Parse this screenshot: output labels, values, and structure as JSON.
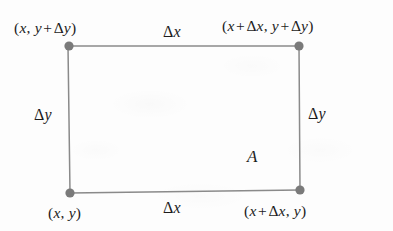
{
  "figure": {
    "type": "geometry-diagram",
    "background_color": "#fdfdfd",
    "line_color": "#8a8a8a",
    "vertex_dot_color": "#7a7a7a",
    "text_color": "#1c1c1c",
    "rectangle": {
      "corners": [
        {
          "name": "bottom-left",
          "x": 70,
          "y": 193,
          "label": "(x, y)"
        },
        {
          "name": "bottom-right",
          "x": 300,
          "y": 190,
          "label": "(x + Δx, y)"
        },
        {
          "name": "top-right",
          "x": 299,
          "y": 46,
          "label": "(x + Δx, y + Δy)"
        },
        {
          "name": "top-left",
          "x": 68,
          "y": 46,
          "label": "(x, y + Δy)"
        }
      ]
    },
    "labels": {
      "top_left_vertex": {
        "open": "(",
        "x": "x",
        "comma": ", ",
        "y": "y",
        "plus": "+",
        "delta": "Δ",
        "dy": "y",
        "close": ")"
      },
      "top_right_vertex": {
        "open": "(",
        "x": "x",
        "plus1": "+",
        "delta1": "Δ",
        "dx": "x",
        "comma": ", ",
        "y": "y",
        "plus2": "+",
        "delta2": "Δ",
        "dy": "y",
        "close": ")"
      },
      "bottom_left_vertex": {
        "open": "(",
        "x": "x",
        "comma": ", ",
        "y": "y",
        "close": ")"
      },
      "bottom_right_vertex": {
        "open": "(",
        "x": "x",
        "plus": "+",
        "delta": "Δ",
        "dx": "x",
        "comma": ", ",
        "y": "y",
        "close": ")"
      },
      "delta_x_top": {
        "delta": "Δ",
        "var": "x"
      },
      "delta_x_bottom": {
        "delta": "Δ",
        "var": "x"
      },
      "delta_y_left": {
        "delta": "Δ",
        "var": "y"
      },
      "delta_y_right": {
        "delta": "Δ",
        "var": "y"
      },
      "area": "A"
    }
  }
}
